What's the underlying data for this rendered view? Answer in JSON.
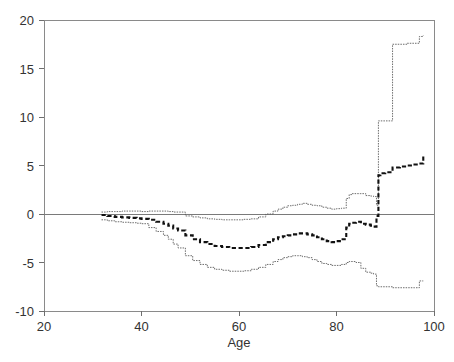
{
  "chart_data": {
    "type": "line",
    "title": "",
    "subtitle": "",
    "xlabel": "Age",
    "ylabel": "",
    "xlim": [
      20,
      100
    ],
    "ylim": [
      -10,
      20
    ],
    "xticks": [
      20,
      40,
      60,
      80,
      100
    ],
    "yticks": [
      -10,
      -5,
      0,
      5,
      10,
      15,
      20
    ],
    "xtick_labels": [
      "20",
      "40",
      "60",
      "80",
      "100"
    ],
    "ytick_labels": [
      "-10",
      "-5",
      "0",
      "5",
      "10",
      "15",
      "20"
    ],
    "grid": false,
    "legend": null,
    "legend_position": "none",
    "annotations": [
      {
        "text": "zero reference line at y = 0",
        "y": 0
      }
    ],
    "series": [
      {
        "name": "Upper confidence bound",
        "style": "dotted-thin",
        "x": [
          31.8,
          33.0,
          34.5,
          36.0,
          37.5,
          39.0,
          40.0,
          41.5,
          43.0,
          44.5,
          45.5,
          46.5,
          47.5,
          49.0,
          50.5,
          52.0,
          53.5,
          55.0,
          56.5,
          58.0,
          59.5,
          61.0,
          62.5,
          64.0,
          65.5,
          67.0,
          68.0,
          69.0,
          70.0,
          71.0,
          72.0,
          73.0,
          74.0,
          75.0,
          76.0,
          77.0,
          78.0,
          79.0,
          80.0,
          81.0,
          82.0,
          82.6,
          83.2,
          84.0,
          85.0,
          86.0,
          87.0,
          87.6,
          88.2,
          88.6,
          89.0,
          90.0,
          91.5,
          93.0,
          94.5,
          96.0,
          97.0,
          97.8
        ],
        "y": [
          0.2,
          0.25,
          0.25,
          0.3,
          0.3,
          0.3,
          0.25,
          0.3,
          0.3,
          0.3,
          0.25,
          0.2,
          0.2,
          -0.2,
          -0.3,
          -0.4,
          -0.5,
          -0.55,
          -0.6,
          -0.6,
          -0.6,
          -0.55,
          -0.5,
          -0.3,
          0.0,
          0.3,
          0.5,
          0.7,
          0.85,
          0.9,
          1.0,
          1.1,
          1.0,
          0.9,
          0.85,
          0.7,
          0.6,
          0.5,
          0.55,
          0.6,
          1.6,
          2.0,
          2.1,
          2.1,
          2.1,
          1.9,
          1.85,
          1.8,
          0.9,
          9.6,
          9.6,
          9.6,
          17.5,
          17.5,
          17.6,
          17.6,
          18.3,
          18.4
        ]
      },
      {
        "name": "Central estimate",
        "style": "dashed-thick",
        "x": [
          31.8,
          33.0,
          34.5,
          36.0,
          37.5,
          39.0,
          40.0,
          41.5,
          43.0,
          44.5,
          45.5,
          46.5,
          47.5,
          49.0,
          50.5,
          52.0,
          53.5,
          55.0,
          56.5,
          58.0,
          59.5,
          61.0,
          62.5,
          64.0,
          65.5,
          67.0,
          68.0,
          69.0,
          70.0,
          71.0,
          72.0,
          73.0,
          74.0,
          75.0,
          76.0,
          77.0,
          78.0,
          79.0,
          80.0,
          81.0,
          82.0,
          82.6,
          83.2,
          84.0,
          85.0,
          86.0,
          87.0,
          87.6,
          88.2,
          88.6,
          89.0,
          90.0,
          91.5,
          93.0,
          94.5,
          96.0,
          97.0,
          97.8
        ],
        "y": [
          -0.1,
          -0.2,
          -0.3,
          -0.35,
          -0.4,
          -0.45,
          -0.5,
          -0.6,
          -0.8,
          -1.0,
          -1.2,
          -1.5,
          -1.7,
          -2.2,
          -2.6,
          -2.9,
          -3.1,
          -3.3,
          -3.4,
          -3.5,
          -3.5,
          -3.5,
          -3.4,
          -3.2,
          -2.9,
          -2.6,
          -2.4,
          -2.3,
          -2.2,
          -2.1,
          -2.0,
          -2.0,
          -2.1,
          -2.2,
          -2.4,
          -2.6,
          -2.8,
          -2.9,
          -2.8,
          -2.6,
          -1.4,
          -1.0,
          -0.9,
          -0.8,
          -1.0,
          -1.1,
          -1.2,
          -1.3,
          -0.2,
          4.0,
          4.2,
          4.3,
          4.8,
          4.9,
          5.0,
          5.1,
          5.2,
          6.0
        ]
      },
      {
        "name": "Lower confidence bound",
        "style": "dotted-thin",
        "x": [
          31.8,
          33.0,
          34.5,
          36.0,
          37.5,
          39.0,
          40.0,
          41.5,
          43.0,
          44.5,
          45.5,
          46.5,
          47.5,
          49.0,
          50.5,
          52.0,
          53.5,
          55.0,
          56.5,
          58.0,
          59.5,
          61.0,
          62.5,
          64.0,
          65.5,
          67.0,
          68.0,
          69.0,
          70.0,
          71.0,
          72.0,
          73.0,
          74.0,
          75.0,
          76.0,
          77.0,
          78.0,
          79.0,
          80.0,
          81.0,
          82.0,
          82.6,
          83.2,
          84.0,
          85.0,
          86.0,
          87.0,
          87.6,
          88.2,
          88.6,
          89.0,
          90.0,
          91.5,
          93.0,
          94.5,
          96.0,
          97.0,
          97.8
        ],
        "y": [
          -0.6,
          -0.7,
          -0.8,
          -0.85,
          -0.9,
          -0.95,
          -1.0,
          -1.4,
          -1.8,
          -2.2,
          -2.6,
          -3.1,
          -3.5,
          -4.3,
          -4.8,
          -5.2,
          -5.5,
          -5.7,
          -5.8,
          -5.9,
          -5.9,
          -5.85,
          -5.7,
          -5.5,
          -5.2,
          -4.9,
          -4.7,
          -4.5,
          -4.4,
          -4.3,
          -4.3,
          -4.4,
          -4.5,
          -4.7,
          -4.9,
          -5.1,
          -5.2,
          -5.3,
          -5.3,
          -5.2,
          -5.0,
          -4.9,
          -4.9,
          -5.0,
          -5.6,
          -6.0,
          -6.1,
          -6.2,
          -7.4,
          -7.5,
          -7.5,
          -7.5,
          -7.6,
          -7.6,
          -7.6,
          -7.6,
          -6.9,
          -6.9
        ]
      }
    ]
  },
  "axes": {
    "x_title": "Age",
    "y_title": ""
  }
}
